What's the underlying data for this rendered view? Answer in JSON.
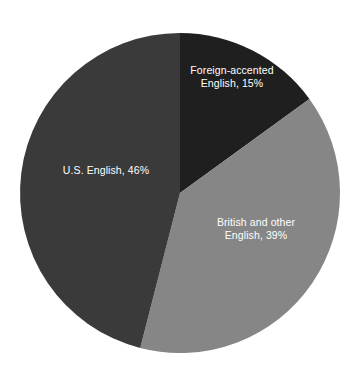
{
  "chart_data": {
    "type": "pie",
    "title": "",
    "subtitle": "",
    "xlabel": "",
    "ylabel": "",
    "grid": false,
    "legend_position": "none",
    "labels_inside_slices": true,
    "background_color": "#ffffff",
    "categories": [
      "Foreign-accented English",
      "British and other English",
      "U.S. English"
    ],
    "values": [
      15,
      39,
      46
    ],
    "unit": "%",
    "total": 100,
    "start_angle_deg": 0,
    "direction": "clockwise",
    "center": {
      "x": 180,
      "y": 193
    },
    "radius": 160,
    "slices": [
      {
        "name": "foreign-accented-english",
        "label": "Foreign-accented\nEnglish, 15%",
        "category": "Foreign-accented English",
        "value": 15,
        "value_text": "15%",
        "color": "#1f1f1f",
        "label_color": "#ffffff",
        "start_angle_deg": 0,
        "end_angle_deg": 54
      },
      {
        "name": "british-and-other-english",
        "label": "British and other\nEnglish, 39%",
        "category": "British and other English",
        "value": 39,
        "value_text": "39%",
        "color": "#868686",
        "label_color": "#ffffff",
        "start_angle_deg": 54,
        "end_angle_deg": 194.4
      },
      {
        "name": "u-s-english",
        "label": "U.S. English, 46%",
        "category": "U.S. English",
        "value": 46,
        "value_text": "46%",
        "color": "#3a3a3a",
        "label_color": "#ffffff",
        "start_angle_deg": 194.4,
        "end_angle_deg": 360
      }
    ]
  }
}
